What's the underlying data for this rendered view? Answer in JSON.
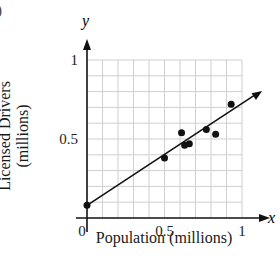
{
  "figure": {
    "corner_fragment": ")",
    "x_axis_var": "x",
    "y_axis_var": "y"
  },
  "chart_data": {
    "type": "scatter",
    "title": "",
    "xlabel": "Population (millions)",
    "ylabel": "Licensed Drivers (millions)",
    "ylabel_lines": [
      "Licensed Drivers",
      "(millions)"
    ],
    "xlim": [
      0,
      1.1
    ],
    "ylim": [
      0,
      1.05
    ],
    "x_ticks": [
      0,
      0.5,
      1
    ],
    "x_tick_labels": [
      "0",
      "0.5",
      "1"
    ],
    "y_ticks": [
      0.5,
      1
    ],
    "y_tick_labels": [
      "0.5",
      "1"
    ],
    "grid": true,
    "grid_step": 0.1,
    "legend": null,
    "series": [
      {
        "name": "data points",
        "points": [
          {
            "x": 0.5,
            "y": 0.38
          },
          {
            "x": 0.61,
            "y": 0.54
          },
          {
            "x": 0.63,
            "y": 0.46
          },
          {
            "x": 0.66,
            "y": 0.47
          },
          {
            "x": 0.77,
            "y": 0.56
          },
          {
            "x": 0.83,
            "y": 0.53
          },
          {
            "x": 0.93,
            "y": 0.72
          }
        ]
      }
    ],
    "trend_line": {
      "intercept_point": {
        "x": 0,
        "y": 0.08
      },
      "slope": 0.64,
      "x_end": 1.13
    },
    "colors": {
      "axes": "#111111",
      "grid": "#cfcfcf",
      "points": "#111111",
      "line": "#111111"
    }
  }
}
